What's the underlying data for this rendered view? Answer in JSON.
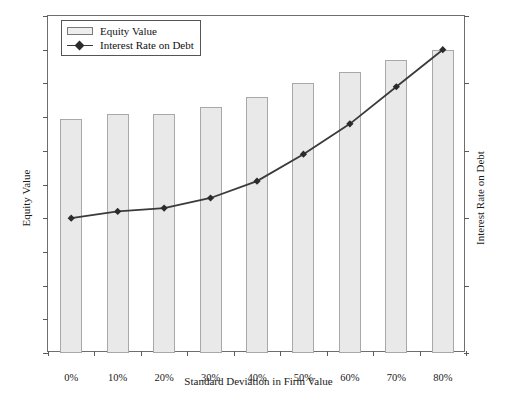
{
  "chart_data": {
    "type": "bar",
    "title": "",
    "xlabel": "Standard Deviation in Firm Value",
    "ylabel": "Equity Value",
    "y2label": "Interest Rate on Debt",
    "categories": [
      "0%",
      "10%",
      "20%",
      "30%",
      "40%",
      "50%",
      "60%",
      "70%",
      "80%"
    ],
    "ylim": [
      0,
      100
    ],
    "y2lim": [
      0,
      25
    ],
    "yticks": [
      "0",
      "10",
      "20",
      "30",
      "40",
      "50",
      "60",
      "70",
      "80",
      "90",
      "100"
    ],
    "y2ticks": [
      "0%",
      "5%",
      "10%",
      "15%",
      "20%",
      "25%"
    ],
    "grid": false,
    "legend_position": "top-left",
    "series": [
      {
        "name": "Equity Value",
        "type": "bar",
        "axis": "left",
        "values": [
          69.3,
          71.0,
          71.0,
          73.0,
          76.0,
          80.0,
          83.5,
          87.0,
          90.0
        ]
      },
      {
        "name": "Interest Rate on Debt",
        "type": "line",
        "axis": "right",
        "values": [
          10.0,
          10.5,
          10.75,
          11.5,
          12.75,
          14.75,
          17.0,
          19.75,
          22.5
        ]
      }
    ]
  },
  "legend": {
    "items": [
      {
        "label": "Equity Value",
        "marker": "bar-swatch"
      },
      {
        "label": "Interest Rate on Debt",
        "marker": "line-diamond-swatch"
      }
    ]
  }
}
